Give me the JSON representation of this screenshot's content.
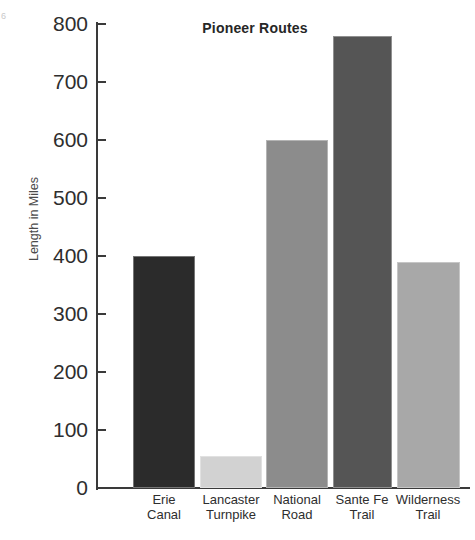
{
  "page": {
    "folio_artifact": "6"
  },
  "chart_data": {
    "type": "bar",
    "title": "Pioneer Routes",
    "xlabel": "",
    "ylabel": "Length in Miles",
    "ylim": [
      0,
      800
    ],
    "grid": false,
    "legend": "none",
    "y_ticks": [
      0,
      100,
      200,
      300,
      400,
      500,
      600,
      700,
      800
    ],
    "y_tick_labels": [
      "0",
      "100",
      "200",
      "300",
      "400",
      "500",
      "600",
      "700",
      "800"
    ],
    "categories": [
      "Erie Canal",
      "Lancaster Turnpike",
      "National Road",
      "Sante Fe Trail",
      "Wilderness Trail"
    ],
    "category_lines": [
      [
        "Erie",
        "Canal"
      ],
      [
        "Lancaster",
        "Turnpike"
      ],
      [
        "National",
        "Road"
      ],
      [
        "Sante Fe",
        "Trail"
      ],
      [
        "Wilderness",
        "Trail"
      ]
    ],
    "values": [
      400,
      55,
      600,
      780,
      390
    ],
    "bar_colors": [
      "#2b2b2b",
      "#d2d2d2",
      "#8c8c8c",
      "#555555",
      "#a8a8a8"
    ],
    "axis_color": "#3a3a3a",
    "text_color": "#2e2e2e",
    "background": "#ffffff"
  }
}
